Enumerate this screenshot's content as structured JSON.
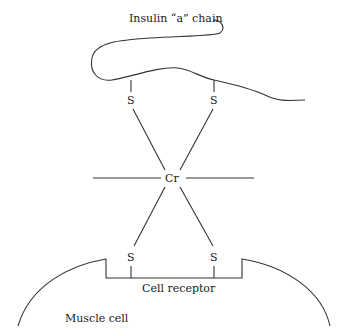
{
  "diagram": {
    "labels": {
      "insulin_chain": "Insulin “a” chain",
      "chromium": "Cr",
      "sulfur_top_left": "S",
      "sulfur_top_right": "S",
      "sulfur_bottom_left": "S",
      "sulfur_bottom_right": "S",
      "cell_receptor": "Cell receptor",
      "muscle_cell": "Muscle cell"
    },
    "nodes": [
      {
        "id": "chain",
        "label": "Insulin “a” chain"
      },
      {
        "id": "S1",
        "label": "S"
      },
      {
        "id": "S2",
        "label": "S"
      },
      {
        "id": "Cr",
        "label": "Cr"
      },
      {
        "id": "S3",
        "label": "S"
      },
      {
        "id": "S4",
        "label": "S"
      },
      {
        "id": "receptor",
        "label": "Cell receptor"
      },
      {
        "id": "cell",
        "label": "Muscle cell"
      }
    ],
    "edges": [
      {
        "from": "chain",
        "to": "S1"
      },
      {
        "from": "chain",
        "to": "S2"
      },
      {
        "from": "S1",
        "to": "Cr"
      },
      {
        "from": "S2",
        "to": "Cr"
      },
      {
        "from": "Cr",
        "to": "S3"
      },
      {
        "from": "Cr",
        "to": "S4"
      },
      {
        "from": "S3",
        "to": "receptor"
      },
      {
        "from": "S4",
        "to": "receptor"
      }
    ]
  }
}
